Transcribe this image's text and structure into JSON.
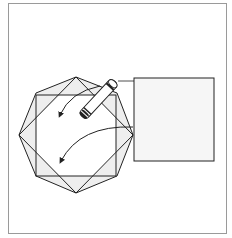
{
  "figure": {
    "colors": {
      "line": "#222222",
      "frame": "#9a9a9a",
      "shade": "#eeeeee",
      "panel_fill": "#f6f6f6"
    },
    "octagon": [
      [
        36,
        93
      ],
      [
        76,
        77
      ],
      [
        117,
        93
      ],
      [
        133,
        135
      ],
      [
        117,
        176
      ],
      [
        76,
        193
      ],
      [
        36,
        176
      ],
      [
        19,
        135
      ]
    ],
    "diamond": [
      [
        76,
        77
      ],
      [
        133,
        135
      ],
      [
        76,
        193
      ],
      [
        19,
        135
      ]
    ],
    "inner_square": {
      "x": 36,
      "y": 95,
      "w": 80,
      "h": 81
    },
    "panel_square": {
      "x": 134,
      "y": 78,
      "w": 80,
      "h": 83
    },
    "pen": {
      "from": [
        82,
        117
      ],
      "to": [
        115,
        81
      ]
    },
    "connector": {
      "from": [
        118,
        81
      ],
      "to": [
        134,
        81
      ]
    },
    "arrows": [
      {
        "from": [
          100,
          86
        ],
        "to": [
          60,
          115
        ]
      },
      {
        "from": [
          133,
          127
        ],
        "to": [
          61,
          161
        ]
      }
    ]
  }
}
